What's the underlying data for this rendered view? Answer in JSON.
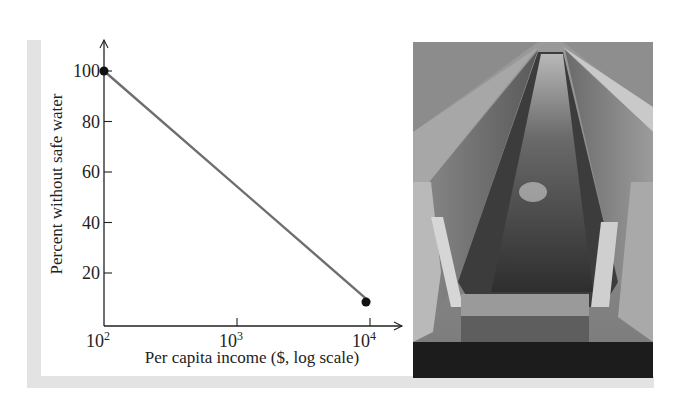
{
  "chart_data": {
    "type": "line",
    "title": "",
    "xlabel": "Per capita income ($, log scale)",
    "ylabel": "Percent without safe water",
    "x_scale": "log",
    "x": [
      100,
      10000
    ],
    "values": [
      100,
      8.5
    ],
    "series": [
      {
        "name": "Percent without safe water",
        "x": [
          100,
          10000
        ],
        "values": [
          100,
          8.5
        ]
      }
    ],
    "x_ticks": [
      {
        "base": "10",
        "exp": "2"
      },
      {
        "base": "10",
        "exp": "3"
      },
      {
        "base": "10",
        "exp": "4"
      }
    ],
    "y_ticks": [
      "20",
      "40",
      "60",
      "80",
      "100"
    ],
    "ylim": [
      0,
      110
    ],
    "xlim": [
      100,
      14000
    ],
    "grid": false,
    "legend": null
  },
  "colors": {
    "line": "#6e6e6e",
    "axis": "#222222",
    "marker": "#111111",
    "panel": "#e3e3e3"
  },
  "photo": {
    "description": "water-treatment-channel-photo"
  }
}
